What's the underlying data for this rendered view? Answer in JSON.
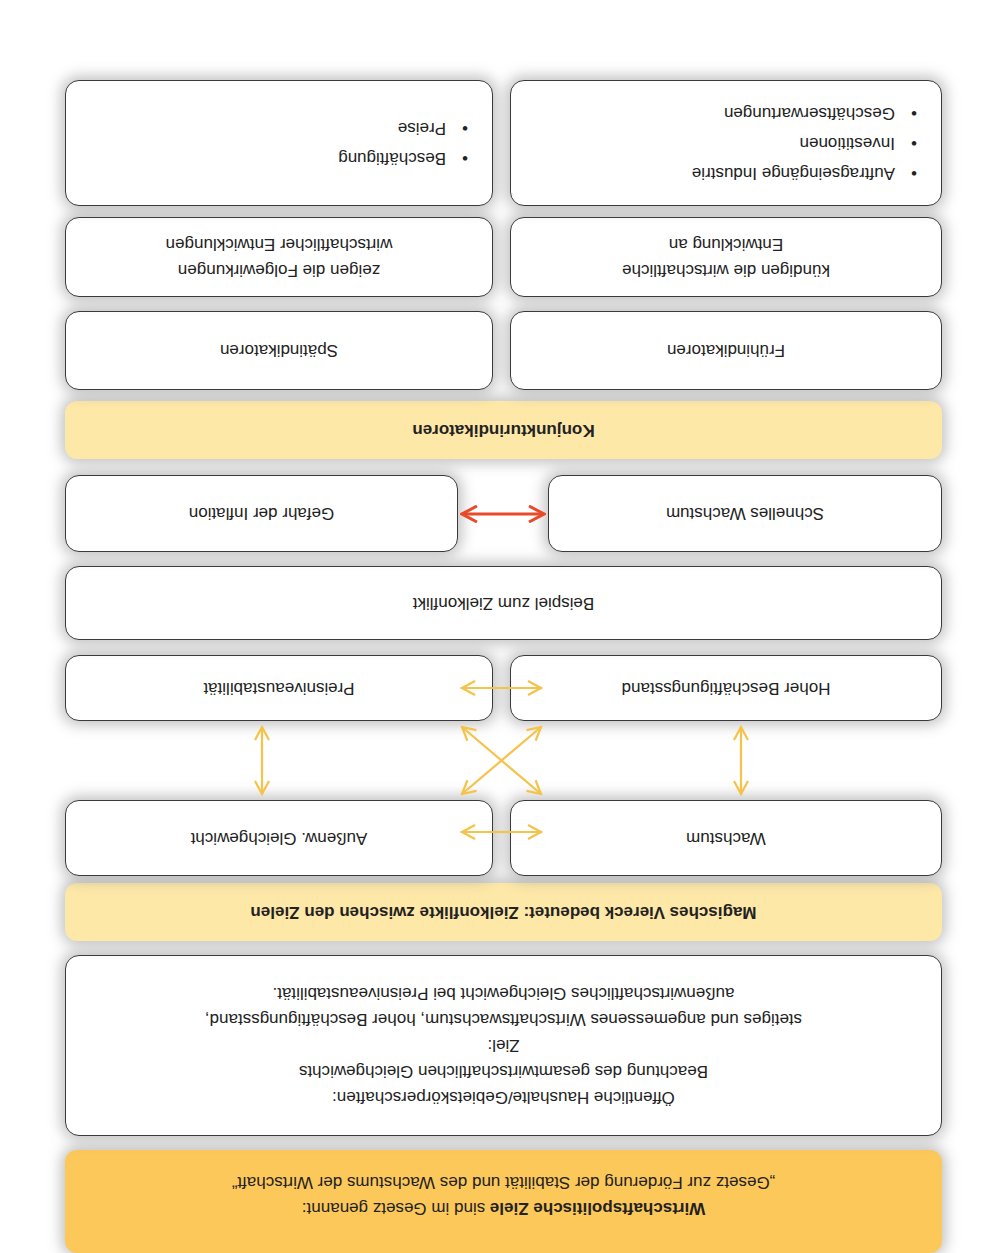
{
  "orientation": "rotated 180 degrees",
  "header": {
    "bold": "Wirtschaftspolitische Ziele",
    "rest": " sind im Gesetz genannt:",
    "law": "„Gesetz zur Förderung der Stabilität und des Wachstums der Wirtschaft“"
  },
  "public_budgets": {
    "line1": "Öffentliche Haushalte/Gebietskörperschaften:",
    "line2": "Beachtung des gesamtwirtschaftlichen Gleichgewichts",
    "line3": "Ziel:",
    "line4": "stetiges und angemessenes Wirtschaftswachstum, hoher Beschäftigungsstand,",
    "line5": "außenwirtschaftliches Gleichgewicht bei Preisniveaustabilität."
  },
  "magic_square": {
    "title": "Magisches Viereck bedeutet: Zielkonflikte zwischen den Zielen",
    "goals": {
      "top_left": "Wachstum",
      "top_right": "Außenw. Gleichgewicht",
      "bottom_left": "Hoher Beschäftigungsstand",
      "bottom_right": "Preisniveaustabilität"
    },
    "arrow_color": "#f5c24a"
  },
  "conflict_example": {
    "title": "Beispiel zum Zielkonflikt",
    "left": "Schnelles Wachstum",
    "right": "Gefahr der Inflation",
    "arrow_color": "#e84a2a"
  },
  "indicators": {
    "title": "Konjunkturindikatoren",
    "early": {
      "label": "Frühindikatoren",
      "desc1": "kündigen die wirtschaftliche",
      "desc2": "Entwicklung an",
      "items": [
        "Auftragseingänge Industrie",
        "Investitionen",
        "Geschäftserwartungen"
      ]
    },
    "late": {
      "label": "Spätindikatoren",
      "desc1": "zeigen die Folgewirkungen",
      "desc2": "wirtschaftlicher Entwicklungen",
      "items": [
        "Beschäftigung",
        "Preise"
      ]
    }
  },
  "colors": {
    "header_orange": "#fdc85a",
    "banner_yellow": "#fde8a8",
    "box_border": "#3a3a3a"
  }
}
